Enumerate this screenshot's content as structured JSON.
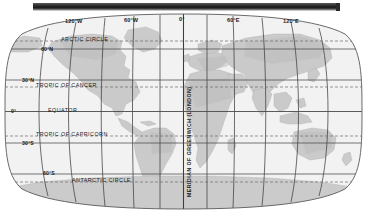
{
  "window": {
    "top_bar": "window-title-bar"
  },
  "map": {
    "title": "World map with graticule",
    "projection": "robinson",
    "colors": {
      "ocean": "#f2f2f2",
      "land": "#c8c8c8",
      "land_alt": "#d6d6d6",
      "graticule": "#3a3a3a",
      "special_line": "#6a6a6a",
      "outline": "#555555",
      "label": "#1c1c1c",
      "bar": "#262626"
    },
    "longitude_labels": [
      {
        "text": "120°W",
        "value": -120
      },
      {
        "text": "60°W",
        "value": -60
      },
      {
        "text": "0°",
        "value": 0
      },
      {
        "text": "60°E",
        "value": 60
      },
      {
        "text": "120°E",
        "value": 120
      }
    ],
    "latitude_labels": [
      {
        "text": "60°N",
        "value": 60
      },
      {
        "text": "30°N",
        "value": 30
      },
      {
        "text": "0°",
        "value": 0
      },
      {
        "text": "30°S",
        "value": -30
      },
      {
        "text": "60°S",
        "value": -60
      }
    ],
    "named_lines": [
      {
        "text": "ARCTIC CIRCLE",
        "value": 66.5,
        "style": "dashed"
      },
      {
        "text": "TROPIC OF CANCER",
        "value": 23.5,
        "style": "dashed"
      },
      {
        "text": "EQUATOR",
        "value": 0,
        "style": "solid"
      },
      {
        "text": "TROPIC OF CAPRICORN",
        "value": -23.5,
        "style": "dashed"
      },
      {
        "text": "ANTARCTIC CIRCLE",
        "value": -66.5,
        "style": "dashed"
      }
    ],
    "prime_meridian_label": "MERIDIAN OF GREENWICH (LONDON)",
    "meridian_spacing_degrees": 30,
    "parallel_spacing_degrees": 30
  }
}
